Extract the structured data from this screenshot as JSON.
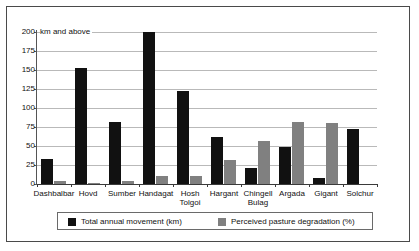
{
  "chart_data": {
    "type": "bar",
    "title": "",
    "subtitle": "",
    "xlabel": "",
    "ylabel": "",
    "axis_note": "km and above",
    "ylim": [
      0,
      200
    ],
    "yticks": [
      0,
      25,
      50,
      75,
      100,
      125,
      150,
      175,
      200
    ],
    "ytick_labels": [
      "0",
      "25",
      "50",
      "75",
      "100",
      "125",
      "150",
      "175",
      "200"
    ],
    "grid": true,
    "legend_position": "bottom",
    "categories": [
      "Dashbalbar",
      "Hovd",
      "Sumber",
      "Handagat",
      "Hosh\nTolgoi",
      "Hargant",
      "Chingell\nBulag",
      "Argada",
      "Gigant",
      "Solchur"
    ],
    "series": [
      {
        "name": "Total annual movement (km)",
        "color": "#111111",
        "values": [
          33,
          152,
          81,
          200,
          122,
          62,
          21,
          49,
          8,
          73
        ]
      },
      {
        "name": "Perceived pasture degradation (%)",
        "color": "#808080",
        "values": [
          4,
          1,
          4,
          11,
          11,
          31,
          57,
          82,
          80,
          0
        ]
      }
    ]
  },
  "legend": {
    "entries": [
      {
        "label": "Total annual movement (km)",
        "color": "#111111"
      },
      {
        "label": "Perceived pasture degradation (%)",
        "color": "#808080"
      }
    ]
  }
}
